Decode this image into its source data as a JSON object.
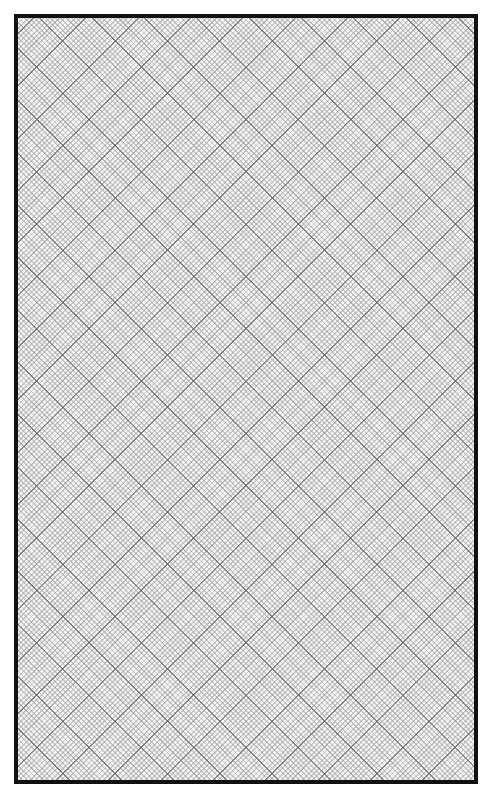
{
  "page": {
    "type": "diagonal-grid-paper",
    "border_color": "#111111",
    "background_color": "#f4f4f4",
    "grid": {
      "orientation_degrees": [
        45,
        -45
      ],
      "major_line_color": "#5a5a5a",
      "fine_line_color": "#969696"
    }
  }
}
